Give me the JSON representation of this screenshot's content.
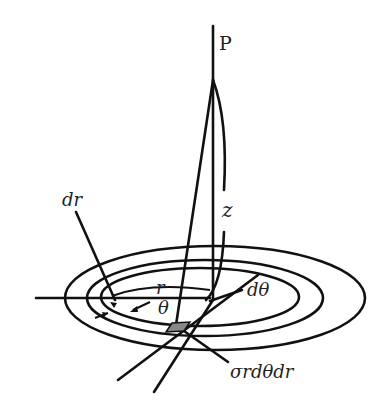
{
  "diagram": {
    "labels": {
      "point": "P",
      "height": "z",
      "radius": "r",
      "angle": "θ",
      "radial_width": "dr",
      "angular_width": "dθ",
      "charge_element": "σrdθdr"
    },
    "colors": {
      "stroke": "#111111",
      "shaded_element": "#888888",
      "background": "#ffffff"
    }
  }
}
